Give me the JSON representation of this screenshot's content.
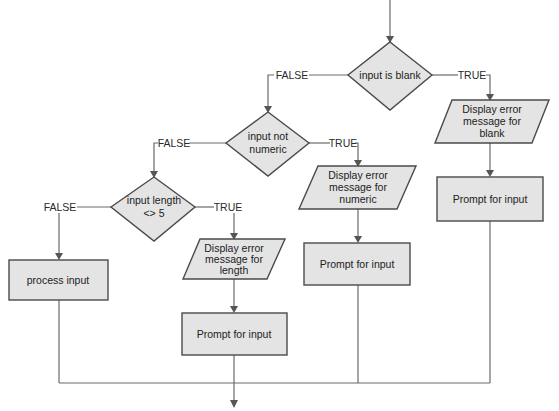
{
  "diagram": {
    "type": "flowchart",
    "colors": {
      "shape_fill": "#e4e4e4",
      "shape_stroke": "#4a4a4a",
      "connector": "#6a6a6a"
    },
    "decisions": [
      {
        "id": "blank",
        "lines": [
          "input is blank"
        ]
      },
      {
        "id": "numeric",
        "lines": [
          "input not",
          "numeric"
        ]
      },
      {
        "id": "length",
        "lines": [
          "input length",
          "<> 5"
        ]
      }
    ],
    "outputs": [
      {
        "id": "err_blank",
        "lines": [
          "Display error",
          "message for",
          "blank"
        ]
      },
      {
        "id": "err_numeric",
        "lines": [
          "Display error",
          "message for",
          "numeric"
        ]
      },
      {
        "id": "err_length",
        "lines": [
          "Display error",
          "message for",
          "length"
        ]
      }
    ],
    "processes": [
      {
        "id": "prompt_blank",
        "lines": [
          "Prompt for input"
        ]
      },
      {
        "id": "prompt_numeric",
        "lines": [
          "Prompt for input"
        ]
      },
      {
        "id": "prompt_length",
        "lines": [
          "Prompt for input"
        ]
      },
      {
        "id": "process",
        "lines": [
          "process input"
        ]
      }
    ],
    "branch_labels": {
      "blank_false": "FALSE",
      "blank_true": "TRUE",
      "numeric_false": "FALSE",
      "numeric_true": "TRUE",
      "length_false": "FALSE",
      "length_true": "TRUE"
    }
  }
}
